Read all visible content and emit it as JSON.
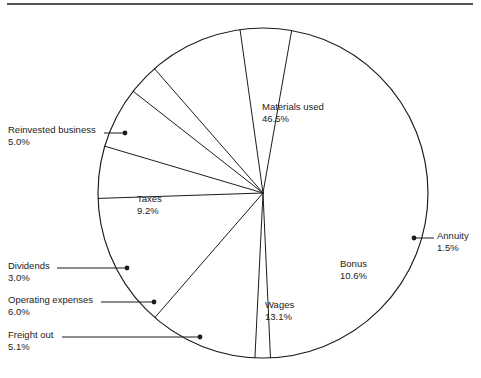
{
  "figure": {
    "background_color": "#ffffff",
    "line_color": "#1c1c1c",
    "top_rule": {
      "x1": 7,
      "y1": 4,
      "x2": 473,
      "y2": 4
    }
  },
  "chart_data": {
    "type": "pie",
    "title": "",
    "subtitle": "",
    "xlabel": "",
    "ylabel": "",
    "legend_position": "none",
    "grid": false,
    "units": "percent",
    "total": 100.0,
    "center": {
      "x": 263,
      "y": 193
    },
    "radius": 165,
    "start_angle_deg": -80,
    "direction": "clockwise",
    "categories": [
      "Materials used",
      "Annuity",
      "Bonus",
      "Wages",
      "Freight out",
      "Operating expenses",
      "Dividends",
      "Taxes",
      "Reinvested business"
    ],
    "values": [
      46.5,
      1.5,
      10.6,
      13.1,
      5.1,
      6.0,
      3.0,
      9.2,
      5.0
    ],
    "slices": [
      {
        "name": "Materials used",
        "value": 46.5,
        "label": "Materials used",
        "value_label": "46.5%",
        "label_placement": "inside",
        "label_x": 262,
        "label_y": 110
      },
      {
        "name": "Annuity",
        "value": 1.5,
        "label": "Annuity",
        "value_label": "1.5%",
        "label_placement": "outside-right",
        "label_x": 437,
        "label_y": 239,
        "leader": {
          "dot_x": 414,
          "dot_y": 238,
          "x1": 414,
          "y1": 238,
          "x2": 434,
          "y2": 238
        }
      },
      {
        "name": "Bonus",
        "value": 10.6,
        "label": "Bonus",
        "value_label": "10.6%",
        "label_placement": "inside",
        "label_x": 340,
        "label_y": 267
      },
      {
        "name": "Wages",
        "value": 13.1,
        "label": "Wages",
        "value_label": "13.1%",
        "label_placement": "inside",
        "label_x": 265,
        "label_y": 308
      },
      {
        "name": "Freight out",
        "value": 5.1,
        "label": "Freight out",
        "value_label": "5.1%",
        "label_placement": "outside-left",
        "label_x": 8,
        "label_y": 338,
        "leader": {
          "dot_x": 200,
          "dot_y": 337,
          "x1": 62,
          "y1": 337,
          "x2": 200,
          "y2": 337
        }
      },
      {
        "name": "Operating expenses",
        "value": 6.0,
        "label": "Operating expenses",
        "value_label": "6.0%",
        "label_placement": "outside-left",
        "label_x": 8,
        "label_y": 303,
        "leader": {
          "dot_x": 154,
          "dot_y": 302,
          "x1": 101,
          "y1": 302,
          "x2": 154,
          "y2": 302
        }
      },
      {
        "name": "Dividends",
        "value": 3.0,
        "label": "Dividends",
        "value_label": "3.0%",
        "label_placement": "outside-left",
        "label_x": 8,
        "label_y": 269,
        "leader": {
          "dot_x": 127,
          "dot_y": 268,
          "x1": 57,
          "y1": 268,
          "x2": 127,
          "y2": 268
        }
      },
      {
        "name": "Taxes",
        "value": 9.2,
        "label": "Taxes",
        "value_label": "9.2%",
        "label_placement": "inside",
        "label_x": 137,
        "label_y": 202
      },
      {
        "name": "Reinvested business",
        "value": 5.0,
        "label": "Reinvested business",
        "value_label": "5.0%",
        "label_placement": "outside-left",
        "label_x": 8,
        "label_y": 133,
        "leader": {
          "dot_x": 125,
          "dot_y": 133,
          "x1": 104,
          "y1": 133,
          "x2": 125,
          "y2": 133
        }
      }
    ]
  }
}
